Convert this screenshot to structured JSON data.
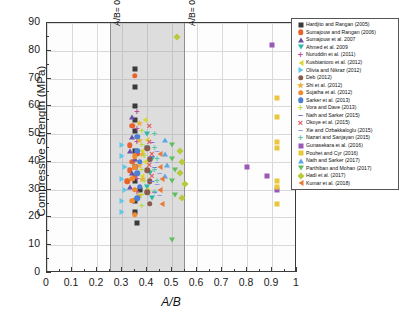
{
  "chart_data": {
    "type": "scatter",
    "title": "",
    "xlabel": "A/B",
    "ylabel": "Compressive Strength (MPa)",
    "xlim": [
      0,
      1
    ],
    "ylim": [
      0,
      90
    ],
    "xticks": [
      "0",
      "0.1",
      "0.2",
      "0.3",
      "0.4",
      "0.5",
      "0.6",
      "0.7",
      "0.8",
      "0.9",
      "1"
    ],
    "xtick_values": [
      0,
      0.1,
      0.2,
      0.3,
      0.4,
      0.5,
      0.6,
      0.7,
      0.8,
      0.9,
      1
    ],
    "yticks": [
      "0",
      "10",
      "20",
      "30",
      "40",
      "50",
      "60",
      "70",
      "80",
      "90"
    ],
    "ytick_values": [
      0,
      10,
      20,
      30,
      40,
      50,
      60,
      70,
      80,
      90
    ],
    "grid": true,
    "legend_position": "outside-right-top",
    "annotations": [
      {
        "text": "A/B= 0.25",
        "x": 0.25,
        "orientation": "vertical"
      },
      {
        "text": "A/B= 0.55",
        "x": 0.55,
        "orientation": "vertical"
      }
    ],
    "shaded_region": {
      "x_start": 0.25,
      "x_end": 0.55,
      "color": "#969696",
      "opacity": 0.3
    },
    "series": [
      {
        "name": "Hardjito and Rangan (2005)",
        "marker": "square",
        "color": "#3a3a3a",
        "points": [
          [
            0.35,
            73.5
          ],
          [
            0.35,
            67
          ],
          [
            0.35,
            60
          ],
          [
            0.35,
            55
          ],
          [
            0.35,
            51
          ],
          [
            0.35,
            44
          ],
          [
            0.35,
            38
          ],
          [
            0.35,
            33
          ],
          [
            0.37,
            30
          ],
          [
            0.35,
            26
          ],
          [
            0.35,
            22
          ],
          [
            0.36,
            18
          ]
        ]
      },
      {
        "name": "Sumajouw and Rangan (2006)",
        "marker": "circle",
        "color": "#e8622c",
        "points": [
          [
            0.35,
            71
          ],
          [
            0.34,
            53
          ],
          [
            0.33,
            46
          ],
          [
            0.36,
            43
          ],
          [
            0.34,
            40
          ],
          [
            0.33,
            37
          ],
          [
            0.35,
            35
          ],
          [
            0.32,
            33
          ]
        ]
      },
      {
        "name": "Sumajouw et al. 2007",
        "marker": "triangle-up",
        "color": "#6b4fa8",
        "points": [
          [
            0.34,
            56
          ],
          [
            0.34,
            49
          ],
          [
            0.33,
            44
          ],
          [
            0.35,
            41
          ],
          [
            0.34,
            36
          ],
          [
            0.33,
            31
          ]
        ]
      },
      {
        "name": "Ahmed et al. 2009",
        "marker": "triangle-down",
        "color": "#2bb8a8",
        "points": [
          [
            0.4,
            50
          ],
          [
            0.4,
            45
          ],
          [
            0.42,
            41
          ],
          [
            0.41,
            36
          ],
          [
            0.4,
            31
          ],
          [
            0.42,
            27
          ]
        ]
      },
      {
        "name": "Nuruddin et al. (2011)",
        "marker": "plus",
        "color": "#b94fa0",
        "points": [
          [
            0.36,
            58
          ],
          [
            0.36,
            52
          ],
          [
            0.36,
            47
          ],
          [
            0.36,
            43
          ],
          [
            0.36,
            38
          ],
          [
            0.36,
            34
          ],
          [
            0.36,
            29
          ]
        ]
      },
      {
        "name": "Kusbiantoro et al. (2012)",
        "marker": "triangle-left",
        "color": "#d6d93a",
        "points": [
          [
            0.39,
            55
          ],
          [
            0.4,
            48
          ],
          [
            0.38,
            44
          ],
          [
            0.39,
            40
          ],
          [
            0.38,
            35
          ],
          [
            0.4,
            30
          ]
        ]
      },
      {
        "name": "Olivia and Nikraz (2012)",
        "marker": "triangle-right",
        "color": "#62c7e8",
        "points": [
          [
            0.3,
            46
          ],
          [
            0.3,
            42
          ],
          [
            0.31,
            38
          ],
          [
            0.3,
            34
          ],
          [
            0.31,
            30
          ],
          [
            0.3,
            26
          ],
          [
            0.3,
            22
          ]
        ]
      },
      {
        "name": "Deb (2012)",
        "marker": "circle",
        "color": "#8a5a4a",
        "points": [
          [
            0.4,
            45
          ],
          [
            0.41,
            41
          ],
          [
            0.4,
            37
          ],
          [
            0.41,
            33
          ],
          [
            0.4,
            29
          ],
          [
            0.41,
            25
          ]
        ]
      },
      {
        "name": "Shi et al. (2012)",
        "marker": "star",
        "color": "#e8b13a",
        "points": [
          [
            0.37,
            54
          ],
          [
            0.37,
            48
          ],
          [
            0.38,
            43
          ],
          [
            0.37,
            39
          ],
          [
            0.38,
            34
          ],
          [
            0.37,
            28
          ]
        ]
      },
      {
        "name": "Sujatha et al. (2012)",
        "marker": "circle",
        "color": "#f08a2c",
        "points": [
          [
            0.35,
            42
          ],
          [
            0.35,
            38
          ],
          [
            0.34,
            34
          ],
          [
            0.35,
            30
          ],
          [
            0.34,
            26
          ],
          [
            0.35,
            21
          ]
        ]
      },
      {
        "name": "Sarker et al. (2013)",
        "marker": "circle",
        "color": "#4a7fd4",
        "points": [
          [
            0.36,
            49
          ],
          [
            0.36,
            44
          ],
          [
            0.37,
            40
          ],
          [
            0.36,
            36
          ],
          [
            0.37,
            31
          ],
          [
            0.36,
            27
          ]
        ]
      },
      {
        "name": "Vora and Dave (2013)",
        "marker": "plus",
        "color": "#b8d93a",
        "points": [
          [
            0.38,
            51
          ],
          [
            0.38,
            46
          ],
          [
            0.39,
            42
          ],
          [
            0.38,
            37
          ],
          [
            0.39,
            33
          ],
          [
            0.38,
            28
          ],
          [
            0.38,
            24
          ]
        ]
      },
      {
        "name": "Nath and Sarker (2015)",
        "marker": "dash",
        "color": "#7a6fd0",
        "points": [
          [
            0.42,
            47
          ],
          [
            0.42,
            42
          ],
          [
            0.43,
            38
          ],
          [
            0.42,
            33
          ],
          [
            0.43,
            29
          ]
        ]
      },
      {
        "name": "Okoye et al. (2015)",
        "marker": "cross",
        "color": "#e8555a",
        "points": [
          [
            0.41,
            53
          ],
          [
            0.41,
            47
          ],
          [
            0.42,
            43
          ],
          [
            0.41,
            39
          ],
          [
            0.42,
            35
          ]
        ]
      },
      {
        "name": "Xie and Ozbakkaloglu (2015)",
        "marker": "dash",
        "color": "#9a9ae0",
        "points": [
          [
            0.44,
            44
          ],
          [
            0.44,
            40
          ],
          [
            0.45,
            36
          ],
          [
            0.44,
            32
          ],
          [
            0.45,
            28
          ]
        ]
      },
      {
        "name": "Nazari and Sanjayan (2015)",
        "marker": "plus",
        "color": "#58c7a8",
        "points": [
          [
            0.43,
            50
          ],
          [
            0.43,
            45
          ],
          [
            0.44,
            41
          ],
          [
            0.43,
            37
          ],
          [
            0.44,
            33
          ],
          [
            0.43,
            29
          ]
        ]
      },
      {
        "name": "Gunasekara et al. (2016)",
        "marker": "square",
        "color": "#9b59b6",
        "points": [
          [
            0.8,
            38
          ],
          [
            0.88,
            35
          ],
          [
            0.9,
            82
          ],
          [
            0.92,
            30
          ]
        ]
      },
      {
        "name": "Pouhet and Cyr (2016)",
        "marker": "square",
        "color": "#e8c83a",
        "points": [
          [
            0.92,
            63
          ],
          [
            0.92,
            56
          ],
          [
            0.92,
            47
          ],
          [
            0.92,
            45
          ],
          [
            0.92,
            33
          ],
          [
            0.92,
            31
          ],
          [
            0.92,
            25
          ]
        ]
      },
      {
        "name": "Nath and Sarker (2017)",
        "marker": "triangle-up",
        "color": "#5aa8e8",
        "points": [
          [
            0.47,
            48
          ],
          [
            0.47,
            43
          ],
          [
            0.48,
            39
          ],
          [
            0.47,
            35
          ]
        ]
      },
      {
        "name": "Parthiban and Mohan (2017)",
        "marker": "triangle-down",
        "color": "#5fbf5f",
        "points": [
          [
            0.5,
            46
          ],
          [
            0.5,
            41
          ],
          [
            0.51,
            37
          ],
          [
            0.5,
            33
          ],
          [
            0.51,
            28
          ],
          [
            0.5,
            12
          ]
        ]
      },
      {
        "name": "Hadi et al. (2017)",
        "marker": "diamond",
        "color": "#b8c93a",
        "points": [
          [
            0.52,
            85
          ],
          [
            0.53,
            44
          ],
          [
            0.54,
            40
          ],
          [
            0.53,
            36
          ],
          [
            0.55,
            32
          ],
          [
            0.54,
            27
          ]
        ]
      },
      {
        "name": "Kumar et al. (2018)",
        "marker": "triangle-left",
        "color": "#e87a3a",
        "points": [
          [
            0.45,
            43
          ],
          [
            0.45,
            38
          ],
          [
            0.46,
            34
          ],
          [
            0.45,
            30
          ],
          [
            0.46,
            25
          ]
        ]
      }
    ]
  }
}
